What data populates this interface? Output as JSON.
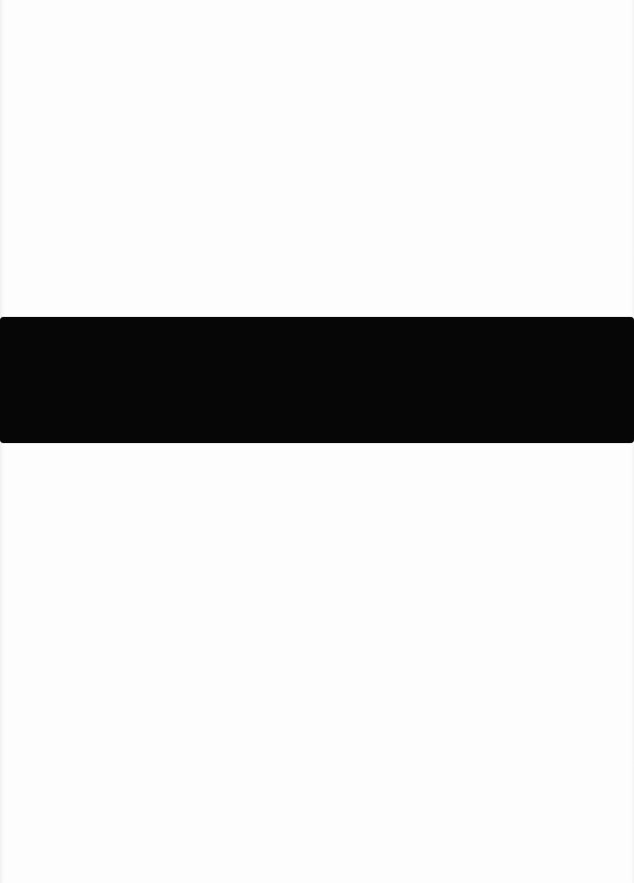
{
  "document": {
    "page_background": "#fdfdfd",
    "text_blocks": []
  },
  "redaction_bar": {
    "color": "#060606",
    "label": ""
  }
}
